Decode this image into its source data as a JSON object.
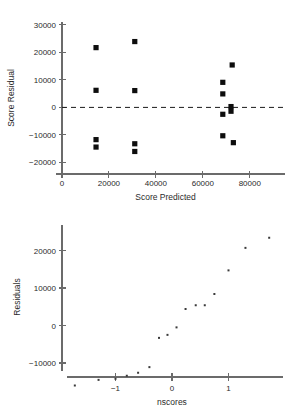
{
  "page": {
    "background": "#ffffff",
    "width": 299,
    "height": 416
  },
  "charts": [
    {
      "id": "score-residual-vs-predicted",
      "xlabel": "Score  Predicted",
      "ylabel": "Score Residual",
      "xticklabels": [
        "0",
        "20000",
        "40000",
        "60000",
        "80000"
      ],
      "yticklabels": [
        "-20000",
        "-10000",
        "0",
        "10000",
        "20000",
        "30000"
      ]
    },
    {
      "id": "residuals-vs-nscores",
      "xlabel": "nscores",
      "ylabel": "Residuals",
      "xticklabels": [
        "-1",
        "0",
        "1"
      ],
      "yticklabels": [
        "-10000",
        "0",
        "10000",
        "20000"
      ]
    }
  ],
  "chart_data": [
    {
      "type": "scatter",
      "title": "",
      "xlabel": "Score  Predicted",
      "ylabel": "Score Residual",
      "xlim": [
        0,
        95000
      ],
      "ylim": [
        -22000,
        31000
      ],
      "xticks": [
        0,
        20000,
        40000,
        60000,
        80000
      ],
      "yticks": [
        -20000,
        -10000,
        0,
        10000,
        20000,
        30000
      ],
      "grid": false,
      "legend": "none",
      "reference_line": {
        "orientation": "horizontal",
        "y": 0,
        "style": "dashed"
      },
      "marker": "filled-square",
      "points": [
        {
          "x": 14500,
          "y": 21700
        },
        {
          "x": 14500,
          "y": 6200
        },
        {
          "x": 14500,
          "y": -11700
        },
        {
          "x": 14500,
          "y": -14400
        },
        {
          "x": 31000,
          "y": 23900
        },
        {
          "x": 31000,
          "y": 6100
        },
        {
          "x": 31000,
          "y": -13200
        },
        {
          "x": 31000,
          "y": -16000
        },
        {
          "x": 68500,
          "y": 9100
        },
        {
          "x": 68500,
          "y": 4900
        },
        {
          "x": 68500,
          "y": -2500
        },
        {
          "x": 68500,
          "y": -10300
        },
        {
          "x": 72500,
          "y": 15400
        },
        {
          "x": 72000,
          "y": 300
        },
        {
          "x": 72000,
          "y": -1400
        },
        {
          "x": 73000,
          "y": -12800
        }
      ]
    },
    {
      "type": "scatter",
      "title": "",
      "xlabel": "nscores",
      "ylabel": "Residuals",
      "xlim": [
        -1.95,
        2.0
      ],
      "ylim": [
        -17500,
        26500
      ],
      "xticks": [
        -1,
        0,
        1
      ],
      "yticks": [
        -10000,
        0,
        10000,
        20000
      ],
      "grid": false,
      "legend": "none",
      "marker": "small-dot",
      "points": [
        {
          "x": -1.72,
          "y": -16000
        },
        {
          "x": -1.3,
          "y": -14500
        },
        {
          "x": -1.0,
          "y": -14200
        },
        {
          "x": -0.8,
          "y": -13400
        },
        {
          "x": -0.6,
          "y": -12600
        },
        {
          "x": -0.4,
          "y": -11100
        },
        {
          "x": -0.23,
          "y": -3300
        },
        {
          "x": -0.08,
          "y": -2500
        },
        {
          "x": 0.08,
          "y": -500
        },
        {
          "x": 0.24,
          "y": 4400
        },
        {
          "x": 0.42,
          "y": 5400
        },
        {
          "x": 0.58,
          "y": 5400
        },
        {
          "x": 0.75,
          "y": 8400
        },
        {
          "x": 1.0,
          "y": 14700
        },
        {
          "x": 1.3,
          "y": 20700
        },
        {
          "x": 1.72,
          "y": 23400
        }
      ]
    }
  ]
}
